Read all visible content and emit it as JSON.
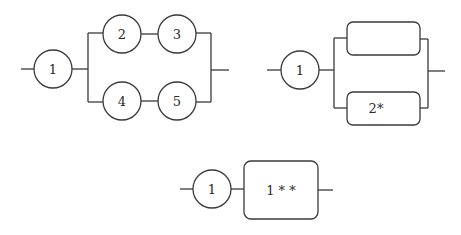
{
  "diagrams": [
    {
      "id": "diagram-a",
      "description": "Component 1 in series with two parallel branches (2-3 and 4-5)",
      "nodes": [
        {
          "label": "1",
          "shape": "circle",
          "cx": 53,
          "cy": 69,
          "r": 19
        },
        {
          "label": "2",
          "shape": "circle",
          "cx": 122,
          "cy": 34,
          "r": 19
        },
        {
          "label": "3",
          "shape": "circle",
          "cx": 177,
          "cy": 34,
          "r": 19
        },
        {
          "label": "4",
          "shape": "circle",
          "cx": 122,
          "cy": 100,
          "r": 19
        },
        {
          "label": "5",
          "shape": "circle",
          "cx": 177,
          "cy": 100,
          "r": 19
        }
      ]
    },
    {
      "id": "diagram-b",
      "description": "Component 1 in series with two parallel boxes (empty and 2*)",
      "nodes": [
        {
          "label": "1",
          "shape": "circle",
          "cx": 300,
          "cy": 70,
          "r": 19
        },
        {
          "label": "",
          "shape": "box",
          "x": 347,
          "y": 22,
          "w": 73,
          "h": 33
        },
        {
          "label": "2*",
          "shape": "box",
          "x": 347,
          "y": 92,
          "w": 73,
          "h": 33
        }
      ]
    },
    {
      "id": "diagram-c",
      "description": "Component 1 in series with reduced block 1**",
      "nodes": [
        {
          "label": "1",
          "shape": "circle",
          "cx": 212,
          "cy": 189,
          "r": 19
        },
        {
          "label": "1 * *",
          "shape": "box",
          "x": 244,
          "y": 161,
          "w": 74,
          "h": 58
        }
      ]
    }
  ]
}
